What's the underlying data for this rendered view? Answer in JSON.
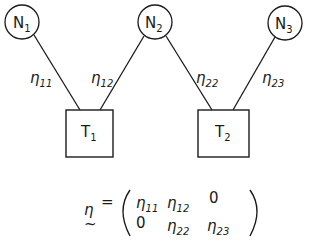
{
  "diagram": {
    "nodes": [
      {
        "id": "N1",
        "base": "N",
        "sub": "1",
        "shape": "circle",
        "cx": 22,
        "cy": 22,
        "r": 17
      },
      {
        "id": "N2",
        "base": "N",
        "sub": "2",
        "shape": "circle",
        "cx": 155,
        "cy": 22,
        "r": 17
      },
      {
        "id": "N3",
        "base": "N",
        "sub": "3",
        "shape": "circle",
        "cx": 285,
        "cy": 23,
        "r": 17
      }
    ],
    "targets": [
      {
        "id": "T1",
        "base": "T",
        "sub": "1",
        "shape": "square",
        "x": 66,
        "y": 110,
        "w": 47,
        "h": 47
      },
      {
        "id": "T2",
        "base": "T",
        "sub": "2",
        "shape": "square",
        "x": 198,
        "y": 110,
        "w": 51,
        "h": 47
      }
    ],
    "edges": [
      {
        "from": "N1",
        "to": "T1",
        "base": "η",
        "sub": "11"
      },
      {
        "from": "N2",
        "to": "T1",
        "base": "η",
        "sub": "12"
      },
      {
        "from": "N2",
        "to": "T2",
        "base": "η",
        "sub": "22"
      },
      {
        "from": "N3",
        "to": "T2",
        "base": "η",
        "sub": "23"
      }
    ],
    "equation": {
      "lhs": "η",
      "lhs_tilde": "~",
      "equals": "=",
      "matrix": [
        [
          {
            "base": "η",
            "sub": "11"
          },
          {
            "base": "η",
            "sub": "12"
          },
          {
            "base": "0",
            "sub": ""
          }
        ],
        [
          {
            "base": "0",
            "sub": ""
          },
          {
            "base": "η",
            "sub": "22"
          },
          {
            "base": "η",
            "sub": "23"
          }
        ]
      ]
    },
    "colors": {
      "stroke": "#1a1a1a",
      "background": "#ffffff"
    }
  }
}
